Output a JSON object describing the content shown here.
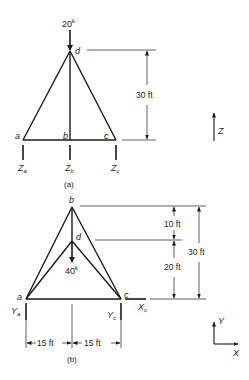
{
  "figure_a": {
    "caption": "(a)",
    "load": {
      "value": "20",
      "unit": "k"
    },
    "nodes": {
      "a": "a",
      "b": "b",
      "c": "c",
      "d": "d"
    },
    "reactions": [
      {
        "base": "Z",
        "sub": "a"
      },
      {
        "base": "Z",
        "sub": "b"
      },
      {
        "base": "Z",
        "sub": "c"
      }
    ],
    "height_dim": "30 ft",
    "axis_label": "Z"
  },
  "figure_b": {
    "caption": "(b)",
    "load": {
      "value": "40",
      "unit": "k"
    },
    "nodes": {
      "a": "a",
      "b": "b",
      "c": "c",
      "d": "d"
    },
    "reactions": [
      {
        "base": "Y",
        "sub": "a"
      },
      {
        "base": "Y",
        "sub": "c"
      },
      {
        "base": "X",
        "sub": "c"
      }
    ],
    "dims": {
      "upper": "10 ft",
      "lower": "20 ft",
      "total": "30 ft",
      "left_span": "15 ft",
      "right_span": "15 ft"
    },
    "axes": {
      "y": "Y",
      "x": "X"
    }
  }
}
